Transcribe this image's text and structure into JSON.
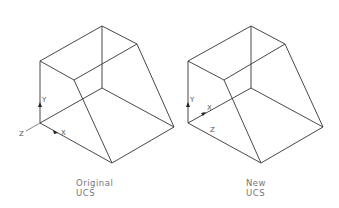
{
  "figures": [
    {
      "caption_line1": "Original",
      "caption_line2": "UCS",
      "axes": {
        "x": "X",
        "y": "Y",
        "z": "Z"
      }
    },
    {
      "caption_line1": "New",
      "caption_line2": "UCS",
      "axes": {
        "x": "X",
        "y": "Y",
        "z": "Z"
      }
    }
  ],
  "colors": {
    "line": "#333333",
    "label": "#777777"
  }
}
